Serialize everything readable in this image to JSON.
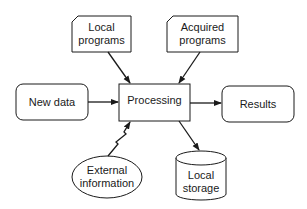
{
  "diagram": {
    "nodes": {
      "local_programs": {
        "line1": "Local",
        "line2": "programs",
        "shape": "card"
      },
      "acquired_programs": {
        "line1": "Acquired",
        "line2": "programs",
        "shape": "card"
      },
      "new_data": {
        "label": "New data",
        "shape": "rounded-rect"
      },
      "processing": {
        "label": "Processing",
        "shape": "rect"
      },
      "results": {
        "label": "Results",
        "shape": "rounded-rect"
      },
      "external_information": {
        "line1": "External",
        "line2": "information",
        "shape": "ellipse"
      },
      "local_storage": {
        "line1": "Local",
        "line2": "storage",
        "shape": "cylinder"
      }
    },
    "edges": [
      {
        "from": "Local programs",
        "to": "Processing",
        "style": "arrow"
      },
      {
        "from": "Acquired programs",
        "to": "Processing",
        "style": "arrow"
      },
      {
        "from": "New data",
        "to": "Processing",
        "style": "arrow"
      },
      {
        "from": "Processing",
        "to": "Results",
        "style": "arrow"
      },
      {
        "from": "External information",
        "to": "Processing",
        "style": "lightning-arrow"
      },
      {
        "from": "Processing",
        "to": "Local storage",
        "style": "arrow"
      }
    ],
    "colors": {
      "stroke": "#1a1a1a",
      "fill": "#ffffff",
      "text": "#1a1a1a"
    }
  }
}
